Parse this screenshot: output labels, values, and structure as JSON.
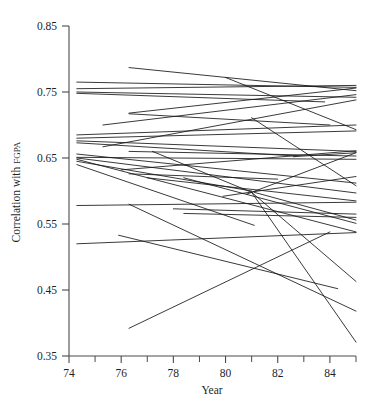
{
  "chart_data": {
    "type": "line",
    "title": "",
    "subtitle": "",
    "xlabel": "Year",
    "ylabel": "Correlation with FGPA",
    "ylabel_main": "Correlation with ",
    "ylabel_smallcaps": "FGPA",
    "xlim": [
      74,
      85
    ],
    "ylim": [
      0.35,
      0.85
    ],
    "grid": false,
    "legend": "none",
    "x_ticks": [
      74,
      76,
      78,
      80,
      82,
      84
    ],
    "x_tick_labels": [
      "74",
      "76",
      "78",
      "80",
      "82",
      "84"
    ],
    "x_minor_ticks": [
      75,
      77,
      79,
      81,
      83,
      85
    ],
    "y_ticks": [
      0.35,
      0.45,
      0.55,
      0.65,
      0.75,
      0.85
    ],
    "y_tick_labels": [
      "0.35",
      "0.45",
      "0.55",
      "0.65",
      "0.75",
      "0.85"
    ],
    "line_color": "#161616",
    "axis_color": "#4a4a4a",
    "series": [
      {
        "name": "inst-01",
        "x": [
          74.3,
          85.0
        ],
        "y": [
          0.765,
          0.757
        ]
      },
      {
        "name": "inst-02",
        "x": [
          74.3,
          85.0
        ],
        "y": [
          0.755,
          0.76
        ]
      },
      {
        "name": "inst-03",
        "x": [
          74.3,
          85.0
        ],
        "y": [
          0.75,
          0.742
        ]
      },
      {
        "name": "inst-04",
        "x": [
          74.3,
          83.8
        ],
        "y": [
          0.748,
          0.735
        ]
      },
      {
        "name": "inst-05",
        "x": [
          76.3,
          85.0
        ],
        "y": [
          0.787,
          0.752
        ]
      },
      {
        "name": "inst-06",
        "x": [
          76.3,
          85.0
        ],
        "y": [
          0.718,
          0.756
        ]
      },
      {
        "name": "inst-07",
        "x": [
          76.3,
          84.0
        ],
        "y": [
          0.717,
          0.7
        ]
      },
      {
        "name": "inst-08",
        "x": [
          75.3,
          85.0
        ],
        "y": [
          0.7,
          0.746
        ]
      },
      {
        "name": "inst-09",
        "x": [
          74.3,
          85.0
        ],
        "y": [
          0.685,
          0.7
        ]
      },
      {
        "name": "inst-10",
        "x": [
          74.3,
          85.0
        ],
        "y": [
          0.68,
          0.691
        ]
      },
      {
        "name": "inst-11",
        "x": [
          74.3,
          85.0
        ],
        "y": [
          0.676,
          0.66
        ]
      },
      {
        "name": "inst-12",
        "x": [
          74.3,
          82.7
        ],
        "y": [
          0.673,
          0.653
        ]
      },
      {
        "name": "inst-13",
        "x": [
          75.3,
          85.0
        ],
        "y": [
          0.667,
          0.738
        ]
      },
      {
        "name": "inst-14",
        "x": [
          76.3,
          85.0
        ],
        "y": [
          0.66,
          0.653
        ]
      },
      {
        "name": "inst-15",
        "x": [
          74.3,
          85.0
        ],
        "y": [
          0.656,
          0.612
        ]
      },
      {
        "name": "inst-16",
        "x": [
          74.3,
          85.0
        ],
        "y": [
          0.651,
          0.648
        ]
      },
      {
        "name": "inst-17",
        "x": [
          74.3,
          85.0
        ],
        "y": [
          0.65,
          0.597
        ]
      },
      {
        "name": "inst-18",
        "x": [
          74.3,
          85.0
        ],
        "y": [
          0.648,
          0.538
        ]
      },
      {
        "name": "inst-19",
        "x": [
          74.3,
          81.0
        ],
        "y": [
          0.645,
          0.6
        ]
      },
      {
        "name": "inst-20",
        "x": [
          76.0,
          85.0
        ],
        "y": [
          0.632,
          0.661
        ]
      },
      {
        "name": "inst-21",
        "x": [
          76.3,
          82.0
        ],
        "y": [
          0.626,
          0.618
        ]
      },
      {
        "name": "inst-22",
        "x": [
          77.0,
          85.0
        ],
        "y": [
          0.62,
          0.585
        ]
      },
      {
        "name": "inst-23",
        "x": [
          74.3,
          85.0
        ],
        "y": [
          0.578,
          0.583
        ]
      },
      {
        "name": "inst-24",
        "x": [
          76.3,
          85.0
        ],
        "y": [
          0.58,
          0.418
        ]
      },
      {
        "name": "inst-25",
        "x": [
          78.0,
          85.0
        ],
        "y": [
          0.573,
          0.565
        ]
      },
      {
        "name": "inst-26",
        "x": [
          78.4,
          85.0
        ],
        "y": [
          0.566,
          0.56
        ]
      },
      {
        "name": "inst-27",
        "x": [
          74.3,
          85.0
        ],
        "y": [
          0.52,
          0.537
        ]
      },
      {
        "name": "inst-28",
        "x": [
          75.9,
          84.3
        ],
        "y": [
          0.533,
          0.452
        ]
      },
      {
        "name": "inst-29",
        "x": [
          76.3,
          84.0
        ],
        "y": [
          0.392,
          0.538
        ]
      },
      {
        "name": "inst-30",
        "x": [
          80.0,
          85.0
        ],
        "y": [
          0.772,
          0.693
        ]
      },
      {
        "name": "inst-31",
        "x": [
          81.0,
          85.0
        ],
        "y": [
          0.711,
          0.608
        ]
      },
      {
        "name": "inst-32",
        "x": [
          82.6,
          85.0
        ],
        "y": [
          0.652,
          0.658
        ]
      },
      {
        "name": "inst-33",
        "x": [
          80.8,
          85.0
        ],
        "y": [
          0.595,
          0.658
        ]
      },
      {
        "name": "inst-34",
        "x": [
          79.9,
          85.0
        ],
        "y": [
          0.592,
          0.622
        ]
      },
      {
        "name": "inst-35",
        "x": [
          78.4,
          85.0
        ],
        "y": [
          0.62,
          0.551
        ]
      },
      {
        "name": "inst-36",
        "x": [
          81.1,
          85.0
        ],
        "y": [
          0.598,
          0.556
        ]
      },
      {
        "name": "inst-37",
        "x": [
          74.3,
          81.1
        ],
        "y": [
          0.64,
          0.548
        ]
      },
      {
        "name": "inst-38",
        "x": [
          81.0,
          85.0
        ],
        "y": [
          0.598,
          0.371
        ]
      },
      {
        "name": "inst-39",
        "x": [
          81.0,
          85.0
        ],
        "y": [
          0.598,
          0.463
        ]
      },
      {
        "name": "inst-40",
        "x": [
          77.2,
          81.0
        ],
        "y": [
          0.66,
          0.598
        ]
      }
    ]
  }
}
